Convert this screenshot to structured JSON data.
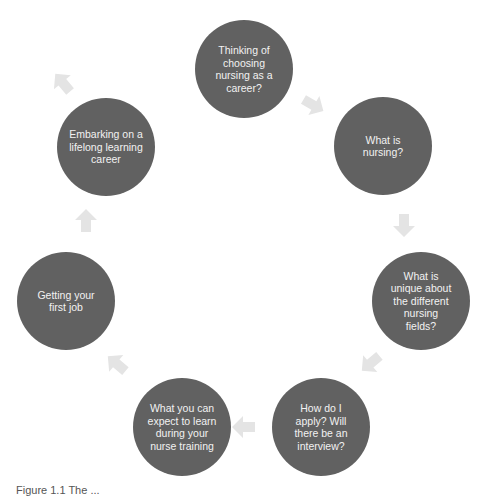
{
  "diagram": {
    "type": "cycle",
    "colors": {
      "node_fill": "#616161",
      "node_text": "#f2f2f2",
      "arrow_fill": "#e4e4e4"
    },
    "nodes": [
      {
        "id": "n1",
        "label": "Thinking of choosing nursing as a career?"
      },
      {
        "id": "n2",
        "label": "What is nursing?"
      },
      {
        "id": "n3",
        "label": "What is unique about the different nursing fields?"
      },
      {
        "id": "n4",
        "label": "How do I apply? Will there be an interview?"
      },
      {
        "id": "n5",
        "label": "What you can expect to learn during your nurse training"
      },
      {
        "id": "n6",
        "label": "Getting your first job"
      },
      {
        "id": "n7",
        "label": "Embarking on a lifelong learning career"
      }
    ],
    "edges": [
      {
        "from": "n1",
        "to": "n2"
      },
      {
        "from": "n2",
        "to": "n3"
      },
      {
        "from": "n3",
        "to": "n4"
      },
      {
        "from": "n4",
        "to": "n5"
      },
      {
        "from": "n5",
        "to": "n6"
      },
      {
        "from": "n6",
        "to": "n7"
      },
      {
        "from": "n7",
        "to": "n1"
      }
    ]
  },
  "caption": "Figure 1.1 The ..."
}
